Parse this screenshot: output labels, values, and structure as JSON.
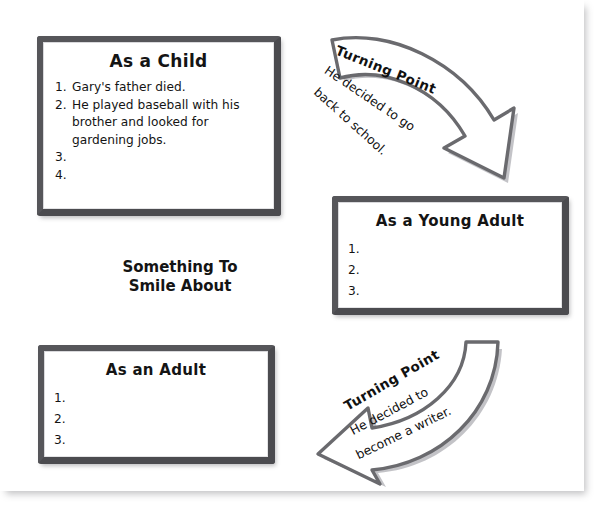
{
  "worksheet": {
    "center_heading_line1": "Something To",
    "center_heading_line2": "Smile About"
  },
  "boards": [
    {
      "id": "as-a-child",
      "title": "As a Child",
      "items": [
        {
          "num": "1.",
          "text": "Gary's father died."
        },
        {
          "num": "2.",
          "text": "He played baseball with his brother and looked for gardening jobs."
        },
        {
          "num": "3.",
          "text": ""
        },
        {
          "num": "4.",
          "text": ""
        }
      ]
    },
    {
      "id": "as-a-young-adult",
      "title": "As a Young Adult",
      "items": [
        {
          "num": "1.",
          "text": ""
        },
        {
          "num": "2.",
          "text": ""
        },
        {
          "num": "3.",
          "text": ""
        }
      ]
    },
    {
      "id": "as-an-adult",
      "title": "As an Adult",
      "items": [
        {
          "num": "1.",
          "text": ""
        },
        {
          "num": "2.",
          "text": ""
        },
        {
          "num": "3.",
          "text": ""
        }
      ]
    }
  ],
  "arrows": [
    {
      "id": "turning-point-top",
      "heading": "Turning Point",
      "line1": "He decided to go",
      "line2": "back to school.",
      "direction": "down-right"
    },
    {
      "id": "turning-point-bottom",
      "heading": "Turning Point",
      "line1": "He decided to",
      "line2": "become a writer.",
      "direction": "down-left"
    }
  ],
  "colors": {
    "board_frame": "#4b4b4f",
    "board_face": "#ffffff",
    "arrow_outline": "#6a6a6e",
    "ink": "#141414",
    "page": "#ffffff"
  }
}
